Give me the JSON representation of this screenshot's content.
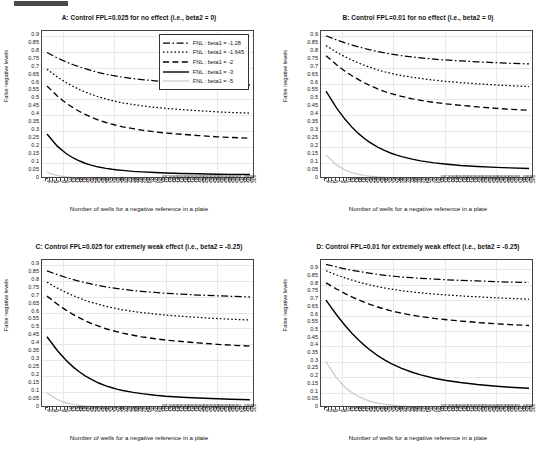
{
  "figure": {
    "xlabel": "Number of wells for a negative reference in a plate",
    "ylabel": "False negative levels",
    "ytick_labels": [
      "0.9",
      "0.85",
      "0.8",
      "0.75",
      "0.7",
      "0.65",
      "0.6",
      "0.55",
      "0.5",
      "0.45",
      "0.4",
      "0.35",
      "0.3",
      "0.25",
      "0.2",
      "0.15",
      "0.1",
      "0.05",
      "0"
    ],
    "xtick_labels": [
      "4",
      "5",
      "6",
      "7",
      "8",
      "9",
      "10",
      "12",
      "14",
      "16",
      "18",
      "20",
      "22",
      "24",
      "26",
      "28",
      "30",
      "32",
      "34",
      "36",
      "38",
      "40",
      "42",
      "44",
      "46",
      "48",
      "50",
      "60",
      "70",
      "80",
      "90",
      "100",
      "110",
      "120",
      "130",
      "140",
      "150",
      "160",
      "170",
      "180",
      "190",
      "200",
      "210",
      "220",
      "230",
      "240",
      "250",
      "260",
      "270",
      "280",
      "290",
      "300",
      "50",
      "100",
      "200",
      "300"
    ],
    "legend": {
      "position": "top-right",
      "entries": [
        {
          "label": "FNL : beta1 = -1.28",
          "style": "dashdot"
        },
        {
          "label": "FNL : beta1 = -1.645",
          "style": "dotted"
        },
        {
          "label": "FNL : beta1 = -2",
          "style": "dashed"
        },
        {
          "label": "FNL : beta1 = -3",
          "style": "solid"
        },
        {
          "label": "FNL : beta1 = -5",
          "style": "solid-light"
        }
      ]
    }
  },
  "chart_data": [
    {
      "panel": "A",
      "type": "line",
      "title": "A: Control FPL=0.025 for no effect (i.e., beta2 = 0)",
      "xlabel": "Number of wells for a negative reference in a plate",
      "ylabel": "False negative levels",
      "ylim": [
        0,
        0.93
      ],
      "xlim_log": [
        4,
        300
      ],
      "grid": true,
      "x": [
        4,
        5,
        6,
        7,
        8,
        9,
        10,
        12,
        14,
        16,
        18,
        20,
        25,
        30,
        40,
        50,
        70,
        100,
        150,
        200,
        300
      ],
      "series": [
        {
          "name": "FNL : beta1 = -1.28",
          "style": "dashdot",
          "values": [
            0.795,
            0.76,
            0.736,
            0.718,
            0.704,
            0.693,
            0.684,
            0.669,
            0.659,
            0.651,
            0.645,
            0.64,
            0.631,
            0.625,
            0.617,
            0.612,
            0.606,
            0.601,
            0.596,
            0.593,
            0.59
          ]
        },
        {
          "name": "FNL : beta1 = -1.645",
          "style": "dotted",
          "values": [
            0.69,
            0.64,
            0.606,
            0.581,
            0.562,
            0.547,
            0.535,
            0.516,
            0.503,
            0.493,
            0.485,
            0.479,
            0.468,
            0.46,
            0.45,
            0.444,
            0.436,
            0.429,
            0.422,
            0.418,
            0.414
          ]
        },
        {
          "name": "FNL : beta1 = -2",
          "style": "dashed",
          "values": [
            0.585,
            0.52,
            0.477,
            0.447,
            0.424,
            0.406,
            0.392,
            0.37,
            0.355,
            0.344,
            0.335,
            0.328,
            0.316,
            0.307,
            0.296,
            0.289,
            0.281,
            0.273,
            0.265,
            0.261,
            0.256
          ]
        },
        {
          "name": "FNL : beta1 = -3",
          "style": "solid",
          "values": [
            0.283,
            0.205,
            0.16,
            0.132,
            0.113,
            0.099,
            0.089,
            0.075,
            0.067,
            0.061,
            0.057,
            0.054,
            0.048,
            0.045,
            0.041,
            0.038,
            0.035,
            0.033,
            0.03,
            0.029,
            0.028
          ]
        },
        {
          "name": "FNL : beta1 = -5",
          "style": "solid-light",
          "values": [
            0.041,
            0.021,
            0.013,
            0.009,
            0.007,
            0.006,
            0.005,
            0.004,
            0.003,
            0.003,
            0.002,
            0.002,
            0.002,
            0.002,
            0.001,
            0.001,
            0.001,
            0.001,
            0.001,
            0.001,
            0.001
          ]
        }
      ]
    },
    {
      "panel": "B",
      "type": "line",
      "title": "B: Control FPL=0.01 for no effect (i.e., beta2 = 0)",
      "xlabel": "Number of wells for a negative reference in a plate",
      "ylabel": "False negative levels",
      "ylim": [
        0,
        0.93
      ],
      "xlim_log": [
        4,
        300
      ],
      "grid": true,
      "x": [
        4,
        5,
        6,
        7,
        8,
        9,
        10,
        12,
        14,
        16,
        18,
        20,
        25,
        30,
        40,
        50,
        70,
        100,
        150,
        200,
        300
      ],
      "series": [
        {
          "name": "FNL : beta1 = -1.28",
          "style": "dashdot",
          "values": [
            0.9,
            0.874,
            0.855,
            0.841,
            0.83,
            0.821,
            0.813,
            0.801,
            0.792,
            0.785,
            0.78,
            0.775,
            0.767,
            0.761,
            0.753,
            0.748,
            0.742,
            0.736,
            0.731,
            0.727,
            0.723
          ]
        },
        {
          "name": "FNL : beta1 = -1.645",
          "style": "dotted",
          "values": [
            0.838,
            0.797,
            0.768,
            0.746,
            0.729,
            0.715,
            0.704,
            0.686,
            0.673,
            0.664,
            0.656,
            0.65,
            0.639,
            0.631,
            0.621,
            0.614,
            0.606,
            0.598,
            0.591,
            0.586,
            0.581
          ]
        },
        {
          "name": "FNL : beta1 = -2",
          "style": "dashed",
          "values": [
            0.775,
            0.718,
            0.677,
            0.647,
            0.624,
            0.605,
            0.59,
            0.566,
            0.549,
            0.537,
            0.527,
            0.519,
            0.504,
            0.494,
            0.481,
            0.473,
            0.463,
            0.453,
            0.444,
            0.438,
            0.432
          ]
        },
        {
          "name": "FNL : beta1 = -3",
          "style": "solid",
          "values": [
            0.552,
            0.447,
            0.375,
            0.323,
            0.285,
            0.256,
            0.233,
            0.2,
            0.178,
            0.162,
            0.15,
            0.141,
            0.125,
            0.114,
            0.101,
            0.094,
            0.085,
            0.079,
            0.073,
            0.07,
            0.066
          ]
        },
        {
          "name": "FNL : beta1 = -5",
          "style": "solid-light",
          "values": [
            0.152,
            0.088,
            0.056,
            0.039,
            0.029,
            0.022,
            0.018,
            0.013,
            0.01,
            0.008,
            0.007,
            0.006,
            0.005,
            0.004,
            0.003,
            0.003,
            0.002,
            0.002,
            0.002,
            0.002,
            0.001
          ]
        }
      ]
    },
    {
      "panel": "C",
      "type": "line",
      "title": "C: Control FPL=0.025 for extremely weak effect (i.e., beta2 = -0.25)",
      "xlabel": "Number of wells for a negative reference in a plate",
      "ylabel": "False negative levels",
      "ylim": [
        0,
        0.93
      ],
      "xlim_log": [
        4,
        300
      ],
      "grid": true,
      "x": [
        4,
        5,
        6,
        7,
        8,
        9,
        10,
        12,
        14,
        16,
        18,
        20,
        25,
        30,
        40,
        50,
        70,
        100,
        150,
        200,
        300
      ],
      "series": [
        {
          "name": "FNL : beta1 = -1.28",
          "style": "dashdot",
          "values": [
            0.862,
            0.838,
            0.82,
            0.807,
            0.796,
            0.788,
            0.781,
            0.769,
            0.761,
            0.755,
            0.75,
            0.746,
            0.738,
            0.733,
            0.726,
            0.721,
            0.715,
            0.71,
            0.705,
            0.702,
            0.698
          ]
        },
        {
          "name": "FNL : beta1 = -1.645",
          "style": "dotted",
          "values": [
            0.79,
            0.753,
            0.726,
            0.706,
            0.69,
            0.677,
            0.667,
            0.651,
            0.639,
            0.63,
            0.623,
            0.617,
            0.607,
            0.6,
            0.59,
            0.584,
            0.576,
            0.569,
            0.562,
            0.558,
            0.553
          ]
        },
        {
          "name": "FNL : beta1 = -2",
          "style": "dashed",
          "values": [
            0.703,
            0.652,
            0.615,
            0.587,
            0.566,
            0.549,
            0.535,
            0.514,
            0.498,
            0.487,
            0.478,
            0.47,
            0.457,
            0.447,
            0.435,
            0.427,
            0.418,
            0.409,
            0.4,
            0.395,
            0.389
          ]
        },
        {
          "name": "FNL : beta1 = -3",
          "style": "solid",
          "values": [
            0.448,
            0.36,
            0.3,
            0.257,
            0.226,
            0.202,
            0.184,
            0.157,
            0.139,
            0.127,
            0.117,
            0.11,
            0.098,
            0.09,
            0.08,
            0.074,
            0.068,
            0.063,
            0.058,
            0.055,
            0.052
          ]
        },
        {
          "name": "FNL : beta1 = -5",
          "style": "solid-light",
          "values": [
            0.094,
            0.052,
            0.032,
            0.022,
            0.016,
            0.012,
            0.01,
            0.007,
            0.005,
            0.004,
            0.004,
            0.003,
            0.003,
            0.002,
            0.002,
            0.002,
            0.001,
            0.001,
            0.001,
            0.001,
            0.001
          ]
        }
      ]
    },
    {
      "panel": "D",
      "type": "line",
      "title": "D: Control FPL=0.01 for extremely weak effect (i.e., beta2 = -0.25)",
      "xlabel": "Number of wells for a negative reference in a plate",
      "ylabel": "False negative levels",
      "ylim": [
        0,
        0.96
      ],
      "xlim_log": [
        4,
        300
      ],
      "grid": true,
      "x": [
        4,
        5,
        6,
        7,
        8,
        9,
        10,
        12,
        14,
        16,
        18,
        20,
        25,
        30,
        40,
        50,
        70,
        100,
        150,
        200,
        300
      ],
      "series": [
        {
          "name": "FNL : beta1 = -1.28",
          "style": "dashdot",
          "values": [
            0.932,
            0.915,
            0.902,
            0.893,
            0.886,
            0.88,
            0.875,
            0.867,
            0.861,
            0.857,
            0.853,
            0.85,
            0.845,
            0.841,
            0.836,
            0.832,
            0.828,
            0.824,
            0.82,
            0.817,
            0.814
          ]
        },
        {
          "name": "FNL : beta1 = -1.645",
          "style": "dotted",
          "values": [
            0.89,
            0.863,
            0.844,
            0.829,
            0.817,
            0.808,
            0.8,
            0.787,
            0.778,
            0.771,
            0.766,
            0.761,
            0.753,
            0.747,
            0.739,
            0.734,
            0.727,
            0.721,
            0.715,
            0.711,
            0.706
          ]
        },
        {
          "name": "FNL : beta1 = -2",
          "style": "dashed",
          "values": [
            0.812,
            0.772,
            0.742,
            0.719,
            0.701,
            0.686,
            0.674,
            0.655,
            0.641,
            0.63,
            0.622,
            0.615,
            0.602,
            0.593,
            0.581,
            0.574,
            0.564,
            0.555,
            0.546,
            0.541,
            0.535
          ]
        },
        {
          "name": "FNL : beta1 = -3",
          "style": "solid",
          "values": [
            0.7,
            0.605,
            0.535,
            0.482,
            0.441,
            0.408,
            0.381,
            0.34,
            0.311,
            0.288,
            0.271,
            0.257,
            0.232,
            0.215,
            0.193,
            0.18,
            0.165,
            0.152,
            0.141,
            0.135,
            0.128
          ]
        },
        {
          "name": "FNL : beta1 = -5",
          "style": "solid-light",
          "values": [
            0.3,
            0.196,
            0.135,
            0.098,
            0.074,
            0.058,
            0.046,
            0.032,
            0.024,
            0.019,
            0.015,
            0.013,
            0.009,
            0.007,
            0.005,
            0.004,
            0.003,
            0.002,
            0.002,
            0.001,
            0.001
          ]
        }
      ]
    }
  ]
}
